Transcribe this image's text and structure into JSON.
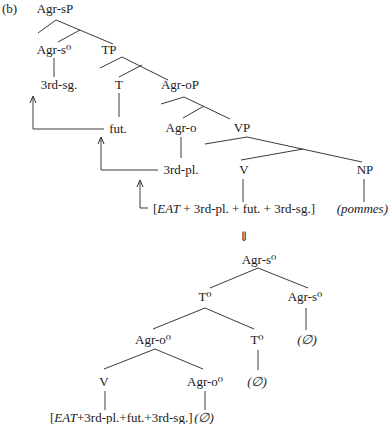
{
  "figure_label": "(b)",
  "top_tree": {
    "nodes": {
      "agr_sp": "Agr-sP",
      "agr_s0": "Agr-s⁰",
      "tp": "TP",
      "third_sg": "3rd-sg.",
      "t": "T",
      "agr_op": "Agr-oP",
      "fut": "fut.",
      "agr_o": "Agr-o",
      "vp": "VP",
      "third_pl": "3rd-pl.",
      "v": "V",
      "np": "NP"
    },
    "terminal": {
      "open_bracket": "[",
      "verb": "EAT",
      "rest": " + 3rd-pl. + fut. + 3rd-sg.]",
      "object": "(pommes)"
    }
  },
  "transition_arrow": "⇓",
  "bottom_tree": {
    "nodes": {
      "root": "Agr-s⁰",
      "t0_upper": "T⁰",
      "agr_s0_right": "Agr-s⁰",
      "agr_s0_null": "(∅)",
      "agr_o0_upper": "Agr-o⁰",
      "t0_lower": "T⁰",
      "t0_null": "(∅)",
      "v": "V",
      "agr_o0_lower": "Agr-o⁰",
      "agr_o0_null": "(∅)"
    },
    "terminal": {
      "open_bracket": "[",
      "verb": "EAT",
      "rest": "+3rd-pl.+fut.+3rd-sg.]"
    }
  }
}
